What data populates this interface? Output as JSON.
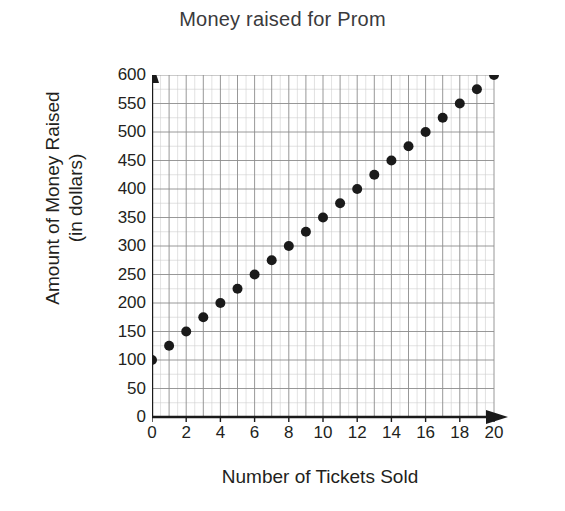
{
  "chart_data": {
    "type": "scatter",
    "title": "Money raised for Prom",
    "xlabel": "Number of Tickets Sold",
    "ylabel_line1": "Amount of Money Raised",
    "ylabel_line2": "(in dollars)",
    "ylabel": "Amount of Money Raised (in dollars)",
    "x": [
      0,
      1,
      2,
      3,
      4,
      5,
      6,
      7,
      8,
      9,
      10,
      11,
      12,
      13,
      14,
      15,
      16,
      17,
      18,
      19,
      20
    ],
    "values": [
      100,
      125,
      150,
      175,
      200,
      225,
      250,
      275,
      300,
      325,
      350,
      375,
      400,
      425,
      450,
      475,
      500,
      525,
      550,
      575,
      600
    ],
    "xlim": [
      0,
      20
    ],
    "ylim": [
      0,
      600
    ],
    "x_tick_labels": [
      "0",
      "2",
      "4",
      "6",
      "8",
      "10",
      "12",
      "14",
      "16",
      "18",
      "20"
    ],
    "x_tick_values": [
      0,
      2,
      4,
      6,
      8,
      10,
      12,
      14,
      16,
      18,
      20
    ],
    "x_tick_step": 2,
    "x_minor_step": 1,
    "y_tick_labels": [
      "0",
      "50",
      "100",
      "150",
      "200",
      "250",
      "300",
      "350",
      "400",
      "450",
      "500",
      "550",
      "600"
    ],
    "y_tick_values": [
      0,
      50,
      100,
      150,
      200,
      250,
      300,
      350,
      400,
      450,
      500,
      550,
      600
    ],
    "y_tick_step": 50,
    "y_minor_step": 25,
    "origin_label": "0",
    "grid": true,
    "legend": "none",
    "point_color": "#1a1a1a",
    "grid_color": "#8c8c8c",
    "minor_grid_color": "#cfcfcf",
    "axis_color": "#1a1a1a",
    "background_color": "#ffffff",
    "x_axis_arrow": true,
    "y_axis_arrow": true
  }
}
